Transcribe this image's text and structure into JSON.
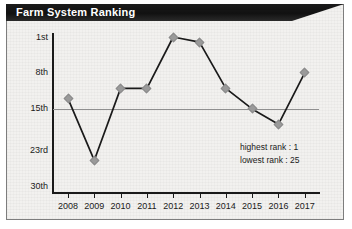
{
  "banner": {
    "title": "Farm System Ranking"
  },
  "chart_data": {
    "type": "line",
    "title": "Farm System Ranking",
    "xlabel": "",
    "ylabel": "",
    "categories": [
      "2008",
      "2009",
      "2010",
      "2011",
      "2012",
      "2013",
      "2014",
      "2015",
      "2016",
      "2017"
    ],
    "values": [
      13,
      25,
      11,
      11,
      1,
      2,
      11,
      15,
      18,
      8
    ],
    "ylim": [
      1,
      30
    ],
    "y_inverted": true,
    "y_tick_values": [
      1,
      8,
      15,
      23,
      30
    ],
    "y_tick_labels": [
      "1st",
      "8th",
      "15th",
      "23rd",
      "30th"
    ],
    "grid": "horizontal-at-15th",
    "legend": "none",
    "marker": "diamond",
    "line_color": "#1a1a1a",
    "marker_color": "#9a9a9a",
    "annotations": [
      "highest rank : 1",
      "lowest rank : 25"
    ]
  },
  "colors": {
    "banner_background": "#111111",
    "banner_text": "#ffffff",
    "card_background": "#f2f1ef",
    "card_border": "#7d7d7d",
    "axis": "#1a1a1a",
    "gridline": "#8f8f8f",
    "line": "#1a1a1a",
    "marker": "#9a9a9a",
    "text": "#1a1a1a"
  }
}
